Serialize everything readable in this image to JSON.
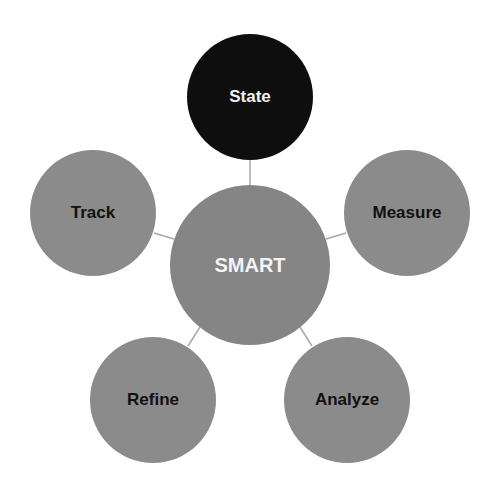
{
  "diagram": {
    "type": "radial-hub",
    "center": {
      "label": "SMART",
      "color": "#858585",
      "text_color": "#f4f4f4"
    },
    "nodes": [
      {
        "label": "State",
        "color": "#0e0e0e",
        "text_color": "#f2f2f2"
      },
      {
        "label": "Measure",
        "color": "#8b8b8b",
        "text_color": "#111111"
      },
      {
        "label": "Analyze",
        "color": "#8b8b8b",
        "text_color": "#111111"
      },
      {
        "label": "Refine",
        "color": "#8b8b8b",
        "text_color": "#111111"
      },
      {
        "label": "Track",
        "color": "#8b8b8b",
        "text_color": "#111111"
      }
    ],
    "connector_color": "#a8a8a8"
  }
}
